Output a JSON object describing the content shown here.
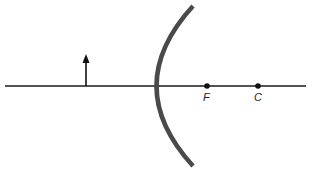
{
  "diagram": {
    "title": "",
    "type": "concave mirror ray diagram",
    "colors": {
      "axis": "#1a1a1a",
      "mirror": "#4a4a4a",
      "object": "#111111",
      "points": "#111111"
    },
    "principal_axis": {
      "x1": 5,
      "x2": 306,
      "y": 86
    },
    "object_arrow": {
      "x": 86,
      "y_base": 86,
      "y_tip": 55,
      "label": ""
    },
    "mirror": {
      "top": [
        193,
        6
      ],
      "vertex": [
        155,
        86
      ],
      "bottom": [
        193,
        166
      ]
    },
    "points": [
      {
        "id": "focal-point",
        "label": "F",
        "x": 207,
        "y": 86
      },
      {
        "id": "center-of-curvature",
        "label": "C",
        "x": 258,
        "y": 86
      }
    ]
  }
}
